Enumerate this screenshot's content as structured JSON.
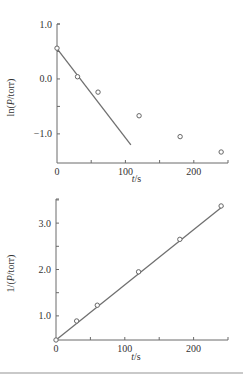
{
  "chart_data": [
    {
      "type": "scatter",
      "title": "",
      "xlabel_italic": "t",
      "xlabel_unit": "/s",
      "ylabel": "ln(P/torr)",
      "xlim": [
        0,
        250
      ],
      "ylim": [
        -1.53,
        1.0
      ],
      "xticks": [
        0,
        50,
        100,
        150,
        200,
        250
      ],
      "xtick_labels": [
        "0",
        "",
        "100",
        "",
        "200",
        ""
      ],
      "yticks": [
        1.0,
        0.5,
        0.0,
        -0.5,
        -1.0
      ],
      "ytick_labels": [
        "1.0",
        "",
        "0.0",
        "",
        "−1.0"
      ],
      "grid": false,
      "series": [
        {
          "name": "data",
          "marker": "open-circle",
          "x": [
            0,
            30,
            60,
            120,
            180,
            240
          ],
          "y": [
            0.56,
            0.04,
            -0.24,
            -0.67,
            -1.05,
            -1.33
          ]
        },
        {
          "name": "fit",
          "style": "line",
          "x": [
            0,
            108
          ],
          "y": [
            0.55,
            -1.2
          ]
        }
      ]
    },
    {
      "type": "scatter",
      "title": "",
      "xlabel_italic": "t",
      "xlabel_unit": "/s",
      "ylabel": "1/(P/torr)",
      "xlim": [
        0,
        250
      ],
      "ylim": [
        0.48,
        3.52
      ],
      "xticks": [
        0,
        50,
        100,
        150,
        200,
        250
      ],
      "xtick_labels": [
        "0",
        "",
        "100",
        "",
        "200",
        ""
      ],
      "yticks": [
        3.5,
        3.0,
        2.5,
        2.0,
        1.5,
        1.0
      ],
      "ytick_labels": [
        "",
        "3.0",
        "",
        "2.0",
        "",
        "1.0"
      ],
      "grid": false,
      "series": [
        {
          "name": "data",
          "marker": "open-circle",
          "x": [
            0,
            30,
            60,
            120,
            180,
            240
          ],
          "y": [
            0.48,
            0.89,
            1.23,
            1.95,
            2.65,
            3.37
          ]
        },
        {
          "name": "fit",
          "style": "line",
          "x": [
            0,
            243
          ],
          "y": [
            0.48,
            3.37
          ]
        }
      ]
    }
  ]
}
